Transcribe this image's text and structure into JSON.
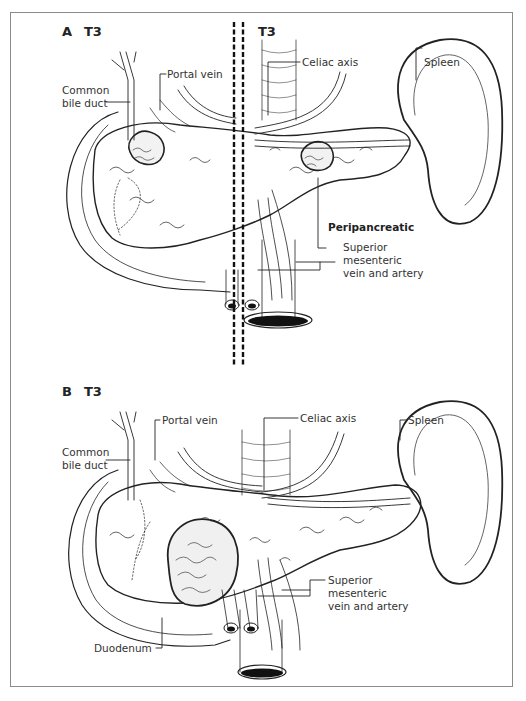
{
  "figure": {
    "panel_a": {
      "letter": "A",
      "stage_left": "T3",
      "stage_right": "T3",
      "labels": {
        "common_bile_duct_1": "Common",
        "common_bile_duct_2": "bile duct",
        "portal_vein": "Portal vein",
        "celiac_axis": "Celiac axis",
        "spleen": "Spleen",
        "peripancreatic": "Peripancreatic",
        "smv_1": "Superior",
        "smv_2": "mesenteric",
        "smv_3": "vein and artery"
      }
    },
    "panel_b": {
      "letter": "B",
      "stage": "T3",
      "labels": {
        "common_bile_duct_1": "Common",
        "common_bile_duct_2": "bile duct",
        "portal_vein": "Portal vein",
        "celiac_axis": "Celiac axis",
        "spleen": "Spleen",
        "smv_1": "Superior",
        "smv_2": "mesenteric",
        "smv_3": "vein and artery",
        "duodenum": "Duodenum"
      }
    },
    "colors": {
      "line": "#222222",
      "frame": "#8a8a8a",
      "background": "#ffffff"
    }
  }
}
